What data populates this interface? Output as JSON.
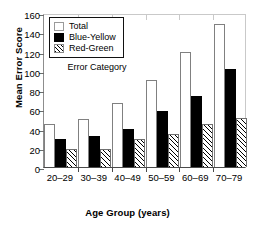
{
  "chart_data": {
    "type": "bar",
    "title": "",
    "xlabel": "Age Group (years)",
    "ylabel": "Mean Error Score",
    "categories": [
      "20–29",
      "30–39",
      "40–49",
      "50–59",
      "60–69",
      "70–79"
    ],
    "series": [
      {
        "name": "Total",
        "values": [
          45,
          49.5,
          67,
          90,
          120,
          149
        ],
        "fill": "white",
        "color": "#ffffff"
      },
      {
        "name": "Blue-Yellow",
        "values": [
          29,
          32,
          40,
          58.5,
          74,
          101.5
        ],
        "fill": "solid",
        "color": "#000000"
      },
      {
        "name": "Red-Green",
        "values": [
          19,
          19,
          29.5,
          34.5,
          44.5,
          50.5
        ],
        "fill": "hatched",
        "color": "#000000"
      }
    ],
    "ylim": [
      0,
      160
    ],
    "yticks": [
      0,
      20,
      40,
      60,
      80,
      100,
      120,
      140,
      160
    ],
    "ytick_labels": [
      "0",
      "20",
      "40",
      "60",
      "80",
      "100",
      "120",
      "140",
      "160"
    ],
    "grid": false,
    "legend_position": "upper-left-inside",
    "legend_caption": "Error Category",
    "annotations": []
  },
  "legend": {
    "items": [
      {
        "label": "Total",
        "swatch": "white-box-icon"
      },
      {
        "label": "Blue-Yellow",
        "swatch": "black-box-icon"
      },
      {
        "label": "Red-Green",
        "swatch": "hatched-box-icon"
      }
    ],
    "caption": "Error Category"
  }
}
